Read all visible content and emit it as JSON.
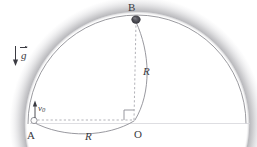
{
  "figure": {
    "kind": "physics-diagram",
    "colors": {
      "ink": "#3b3b42",
      "dome_shade": "#9a9a9f",
      "bead_fill": "#4a4a50",
      "background": "#ffffff",
      "baseline": "#b9b9be"
    },
    "labels": {
      "point_b": "B",
      "point_a": "A",
      "point_o": "O",
      "radius_vertical": "R",
      "radius_horizontal": "R",
      "gravity": "g",
      "initial_velocity": "v",
      "initial_velocity_subscript": "0"
    },
    "annotations": {
      "right_angle_at_o": "right angle marker at O between OA and OB",
      "gravity_direction": "downward arrow",
      "v0_direction": "upward arrow at A"
    }
  }
}
